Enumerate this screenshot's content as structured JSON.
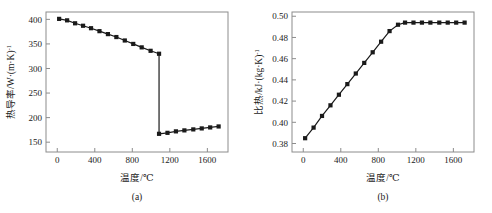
{
  "figure": {
    "panels": [
      {
        "id": "panel-a",
        "caption": "(a)",
        "xlabel": "温度/℃",
        "ylabel_main": "热导率/W·(m·K)",
        "ylabel_sup": "-1"
      },
      {
        "id": "panel-b",
        "caption": "(b)",
        "xlabel": "温度/℃",
        "ylabel_main": "比热/kJ·(kg·K)",
        "ylabel_sup": "-1"
      }
    ]
  },
  "chart_data": [
    {
      "type": "line",
      "panel": "(a)",
      "title": "",
      "xlabel": "温度/℃",
      "ylabel": "热导率/W·(m·K)⁻¹",
      "xlim": [
        -120,
        1820
      ],
      "ylim": [
        130,
        415
      ],
      "xticks": [
        0,
        400,
        800,
        1200,
        1600
      ],
      "yticks": [
        150,
        200,
        250,
        300,
        350,
        400
      ],
      "grid": false,
      "legend": "none",
      "marker": "filled-square",
      "series": [
        {
          "name": "thermal-conductivity-solid",
          "x": [
            20,
            105,
            190,
            275,
            360,
            450,
            540,
            630,
            720,
            810,
            900,
            995,
            1085
          ],
          "y": [
            401,
            398,
            392,
            387,
            382,
            376,
            370,
            364,
            357,
            350,
            343,
            336,
            330
          ]
        },
        {
          "name": "thermal-conductivity-liquid",
          "x": [
            1085,
            1175,
            1265,
            1355,
            1450,
            1540,
            1630,
            1720
          ],
          "y": [
            167,
            169,
            172,
            174,
            176,
            178,
            180,
            182
          ]
        }
      ],
      "transition": {
        "temperature": 1085,
        "value_before": 330,
        "value_after": 167
      }
    },
    {
      "type": "line",
      "panel": "(b)",
      "title": "",
      "xlabel": "温度/℃",
      "ylabel": "比热/kJ·(kg·K)⁻¹",
      "xlim": [
        -120,
        1820
      ],
      "ylim": [
        0.372,
        0.504
      ],
      "xticks": [
        0,
        400,
        800,
        1200,
        1600
      ],
      "yticks": [
        0.38,
        0.4,
        0.42,
        0.44,
        0.46,
        0.48,
        0.5
      ],
      "grid": false,
      "legend": "none",
      "marker": "filled-square",
      "series": [
        {
          "name": "specific-heat",
          "x": [
            20,
            110,
            200,
            290,
            380,
            470,
            560,
            650,
            740,
            830,
            920,
            1010,
            1085,
            1175,
            1265,
            1355,
            1450,
            1540,
            1630,
            1720
          ],
          "y": [
            0.385,
            0.395,
            0.406,
            0.416,
            0.426,
            0.436,
            0.446,
            0.456,
            0.466,
            0.476,
            0.486,
            0.492,
            0.494,
            0.494,
            0.494,
            0.494,
            0.494,
            0.494,
            0.494,
            0.494
          ]
        }
      ],
      "transition": {
        "temperature": 1085,
        "plateau_value": 0.494
      }
    }
  ],
  "style": {
    "line_color": "#1a1a1a",
    "marker_color": "#1a1a1a",
    "frame_color": "#8c8c8c",
    "background": "#ffffff",
    "text_color": "#1a1a1a"
  }
}
